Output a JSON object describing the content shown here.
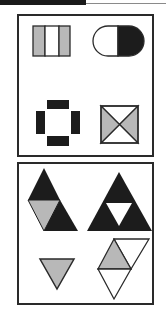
{
  "puzzle": {
    "colors": {
      "black": "#1c1c1c",
      "gray": "#b8b8b8",
      "white": "#ffffff",
      "stroke": "#2a2a2a"
    },
    "question_panel": {
      "figures": [
        {
          "position": "top-left",
          "shape": "rectangle divided into three vertical strips",
          "fills": [
            "gray",
            "white",
            "gray"
          ]
        },
        {
          "position": "top-right",
          "shape": "pill / rounded capsule split vertically",
          "fills": [
            "white",
            "black"
          ]
        },
        {
          "position": "bottom-left",
          "shape": "four black rectangles arranged as a hollow cross",
          "fills": [
            "black"
          ]
        },
        {
          "position": "bottom-right",
          "shape": "square with X diagonals",
          "fills": [
            "white",
            "gray",
            "white",
            "gray"
          ]
        }
      ]
    },
    "options_panel": {
      "figures": [
        {
          "position": "top-left",
          "shape": "parallelogram of triangles",
          "fills": [
            "black",
            "gray",
            "black"
          ]
        },
        {
          "position": "top-right",
          "shape": "Sierpinski triangle",
          "fills": [
            "black",
            "black",
            "black",
            "white"
          ]
        },
        {
          "position": "bottom-left",
          "shape": "inverted triangle",
          "fills": [
            "gray"
          ]
        },
        {
          "position": "bottom-right",
          "shape": "three triangles rhombus",
          "fills": [
            "gray",
            "white",
            "white"
          ]
        }
      ]
    }
  }
}
